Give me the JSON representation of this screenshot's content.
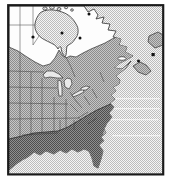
{
  "map": {
    "kind": "printed-species-range-map",
    "area": "eastern-north-america",
    "colors": {
      "page_bg": "#ffffff",
      "frame": "#1a1a1a",
      "coastline": "#2f2f2f",
      "state_line": "#3a3a3a",
      "land": "#fdfdfd",
      "lake": "#e9e9e9",
      "stipple_bg": "#f5f5f5",
      "stipple_dot": "#bdbdbd",
      "medium_bg": "#c6c6c6",
      "medium_dot": "#8d8d8d",
      "dark_bg": "#8f8f8f",
      "dark_dot": "#4e4e4e",
      "marker": "#111111",
      "island_white": "#ffffff"
    },
    "zones": [
      {
        "name": "water",
        "fill": "light-stipple"
      },
      {
        "name": "out-of-range-land",
        "fill": "white"
      },
      {
        "name": "medium-shaded-range",
        "fill": "medium-gray-halftone"
      },
      {
        "name": "dark-shaded-range",
        "fill": "dark-gray-halftone"
      }
    ],
    "markers": [
      {
        "shape": "dot",
        "x": 33,
        "y": 37
      },
      {
        "shape": "dot",
        "x": 62,
        "y": 33
      },
      {
        "shape": "dot",
        "x": 80,
        "y": 38
      },
      {
        "shape": "dot",
        "x": 89,
        "y": 14
      },
      {
        "shape": "dot",
        "x": 138.5,
        "y": 61
      },
      {
        "shape": "square",
        "x": 151.5,
        "y": 53
      }
    ]
  }
}
